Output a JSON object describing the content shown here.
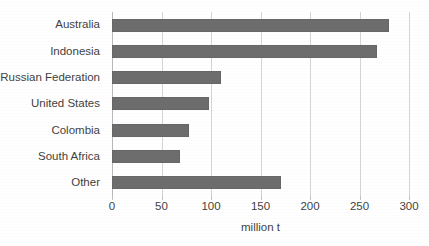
{
  "chart_data": {
    "type": "bar",
    "orientation": "horizontal",
    "title": "",
    "subtitle": "",
    "xlabel": "million t",
    "ylabel": "",
    "categories": [
      "Australia",
      "Indonesia",
      "Russian Federation",
      "United States",
      "Colombia",
      "South Africa",
      "Other"
    ],
    "values": [
      280,
      268,
      110,
      98,
      78,
      69,
      171
    ],
    "xlim": [
      0,
      300
    ],
    "xticks": [
      0,
      50,
      100,
      150,
      200,
      250,
      300
    ],
    "xtick_labels": [
      "0",
      "50",
      "100",
      "150",
      "200",
      "250",
      "300"
    ],
    "grid": "vertical",
    "legend": "none",
    "bar_color": "#6d6d6d",
    "gridline_color": "#d4d4d4",
    "background_color": "#ffffff",
    "text_color": "#3f3f3f"
  }
}
